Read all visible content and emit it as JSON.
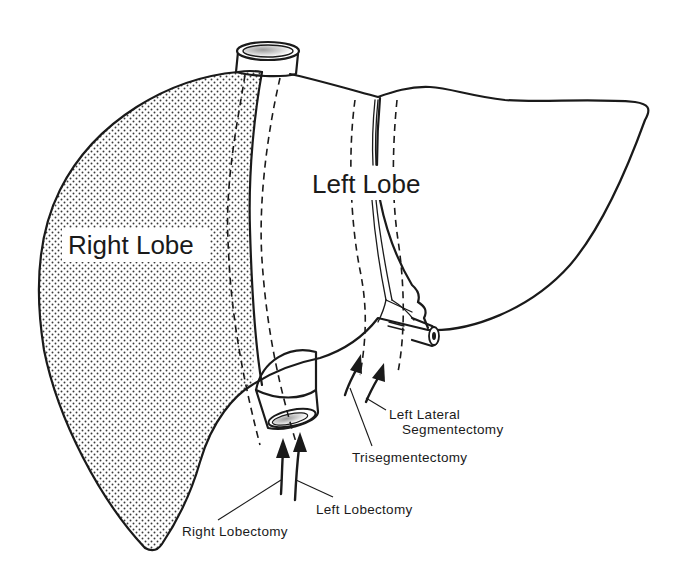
{
  "figure": {
    "type": "anatomical line drawing",
    "colors": {
      "ink": "#1a1a1a",
      "background": "#ffffff",
      "stipple": "#3a3a3a"
    }
  },
  "regions": {
    "right_lobe": {
      "label": "Right Lobe",
      "fill": "stippled"
    },
    "left_lobe": {
      "label": "Left Lobe",
      "fill": "none"
    }
  },
  "procedures": [
    {
      "id": "right-lobectomy",
      "label": "Right Lobectomy"
    },
    {
      "id": "left-lobectomy",
      "label": "Left Lobectomy"
    },
    {
      "id": "trisegmentectomy",
      "label": "Trisegmentectomy"
    },
    {
      "id": "left-lateral-segmentectomy",
      "label_line1": "Left Lateral",
      "label_line2": "Segmentectomy"
    }
  ]
}
